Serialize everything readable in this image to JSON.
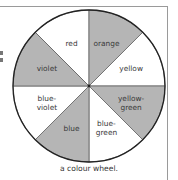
{
  "diagram": {
    "title": "a colour wheel.",
    "center": [
      89,
      86
    ],
    "radius": 76,
    "colors": {
      "shaded": "#b5b5b5",
      "unshaded": "#ffffff",
      "outline": "#222222",
      "text": "#3a3a3a"
    },
    "sectors": [
      {
        "label": "red",
        "lines": [
          "red"
        ],
        "shaded": false
      },
      {
        "label": "orange",
        "lines": [
          "orange"
        ],
        "shaded": true
      },
      {
        "label": "yellow",
        "lines": [
          "yellow"
        ],
        "shaded": false
      },
      {
        "label": "yellow-green",
        "lines": [
          "yellow-",
          "green"
        ],
        "shaded": true
      },
      {
        "label": "blue-green",
        "lines": [
          "blue-",
          "green"
        ],
        "shaded": false
      },
      {
        "label": "blue",
        "lines": [
          "blue"
        ],
        "shaded": true
      },
      {
        "label": "blue-violet",
        "lines": [
          "blue-",
          "violet"
        ],
        "shaded": false
      },
      {
        "label": "violet",
        "lines": [
          "violet"
        ],
        "shaded": true
      }
    ]
  }
}
